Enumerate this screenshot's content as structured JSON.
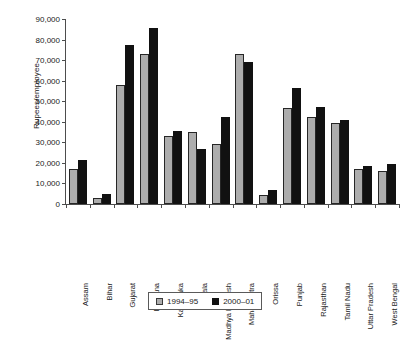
{
  "chart_data": {
    "type": "bar",
    "title": "",
    "xlabel": "",
    "ylabel": "Rupees/employee",
    "ylim": [
      0,
      90000
    ],
    "yticks": [
      "0",
      "10,000",
      "20,000",
      "30,000",
      "40,000",
      "50,000",
      "60,000",
      "70,000",
      "80,000",
      "90,000"
    ],
    "ytick_values": [
      0,
      10000,
      20000,
      30000,
      40000,
      50000,
      60000,
      70000,
      80000,
      90000
    ],
    "grid": false,
    "legend_position": "bottom",
    "categories": [
      "Assam",
      "Bihar",
      "Gujarat",
      "Haryana",
      "Karnataka",
      "Kerala",
      "Madhya Pradesh",
      "Maharashtra",
      "Orissa",
      "Punjab",
      "Rajasthan",
      "Tamil Nadu",
      "Uttar Pradesh",
      "West Bengal"
    ],
    "series": [
      {
        "name": "1994–95",
        "color": "#adadad",
        "values": [
          16900,
          3000,
          58000,
          72800,
          33000,
          35000,
          29000,
          72800,
          4200,
          46700,
          42200,
          39500,
          17200,
          16200
        ]
      },
      {
        "name": "2000–01",
        "color": "#111111",
        "values": [
          21200,
          5000,
          77200,
          85400,
          35300,
          26700,
          42100,
          69200,
          7000,
          56300,
          47400,
          40700,
          18600,
          19400
        ]
      }
    ]
  }
}
